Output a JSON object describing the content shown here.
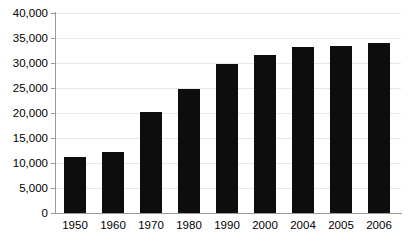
{
  "chart_data": {
    "type": "bar",
    "title": "",
    "subtitle": "",
    "xlabel": "",
    "ylabel": "",
    "categories": [
      "1950",
      "1960",
      "1970",
      "1980",
      "1990",
      "2000",
      "2004",
      "2005",
      "2006"
    ],
    "values": [
      11200,
      12200,
      20200,
      24900,
      29900,
      31700,
      33200,
      33500,
      34000
    ],
    "ylim": [
      0,
      40000
    ],
    "ytick_step": 5000,
    "ytick_labels": [
      "40,000",
      "35,000",
      "30,000",
      "25,000",
      "20,000",
      "15,000",
      "10,000",
      "5,000",
      "0"
    ],
    "ytick_values": [
      40000,
      35000,
      30000,
      25000,
      20000,
      15000,
      10000,
      5000,
      0
    ],
    "grid": true,
    "grid_axis": "y",
    "legend": false,
    "legend_position": "none",
    "series": [
      {
        "name": "",
        "values": [
          11200,
          12200,
          20200,
          24900,
          29900,
          31700,
          33200,
          33500,
          34000
        ]
      }
    ],
    "annotations": []
  },
  "style": {
    "bar_color": "#0d0d0d",
    "grid_color": "#e8e8ec",
    "axis_color": "#9a9a9a",
    "background": "#ffffff",
    "text_color": "#000000"
  }
}
